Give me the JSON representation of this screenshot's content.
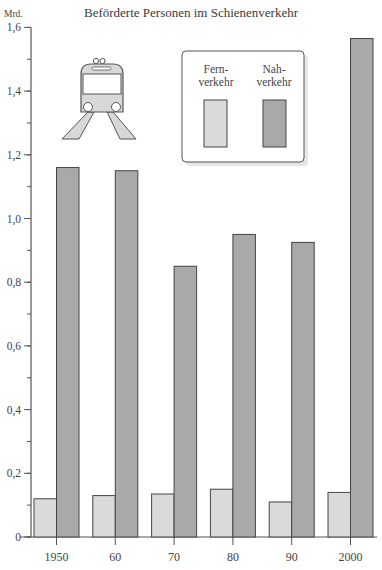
{
  "chart_data": {
    "type": "bar",
    "title": "Beförderte Personen im Schienenverkehr",
    "ylabel": "Mrd.",
    "xlabel": "",
    "categories": [
      "1950",
      "60",
      "70",
      "80",
      "90",
      "2000"
    ],
    "series": [
      {
        "name": "Fernverkehr",
        "legend_lines": [
          "Fern-",
          "verkehr"
        ],
        "color": "#dadada",
        "values": [
          0.12,
          0.13,
          0.135,
          0.15,
          0.11,
          0.14
        ]
      },
      {
        "name": "Nahverkehr",
        "legend_lines": [
          "Nah-",
          "verkehr"
        ],
        "color": "#a9a9a9",
        "values": [
          1.16,
          1.15,
          0.85,
          0.95,
          0.925,
          1.565
        ]
      }
    ],
    "ylim": [
      0,
      1.6
    ],
    "yticks": [
      0,
      0.2,
      0.4,
      0.6,
      0.8,
      1.0,
      1.2,
      1.4,
      1.6
    ],
    "ytick_labels": [
      "0",
      "0,2",
      "0,4",
      "0,6",
      "0,8",
      "1,0",
      "1,2",
      "1,4",
      "1,6"
    ],
    "minor_yticks_step": 0.1,
    "grid": false,
    "legend_position": "top-center-right, boxed with shadow",
    "decoration": "train-icon"
  },
  "header": {
    "title": "Beförderte Personen im Schienenverkehr",
    "unit": "Mrd."
  }
}
